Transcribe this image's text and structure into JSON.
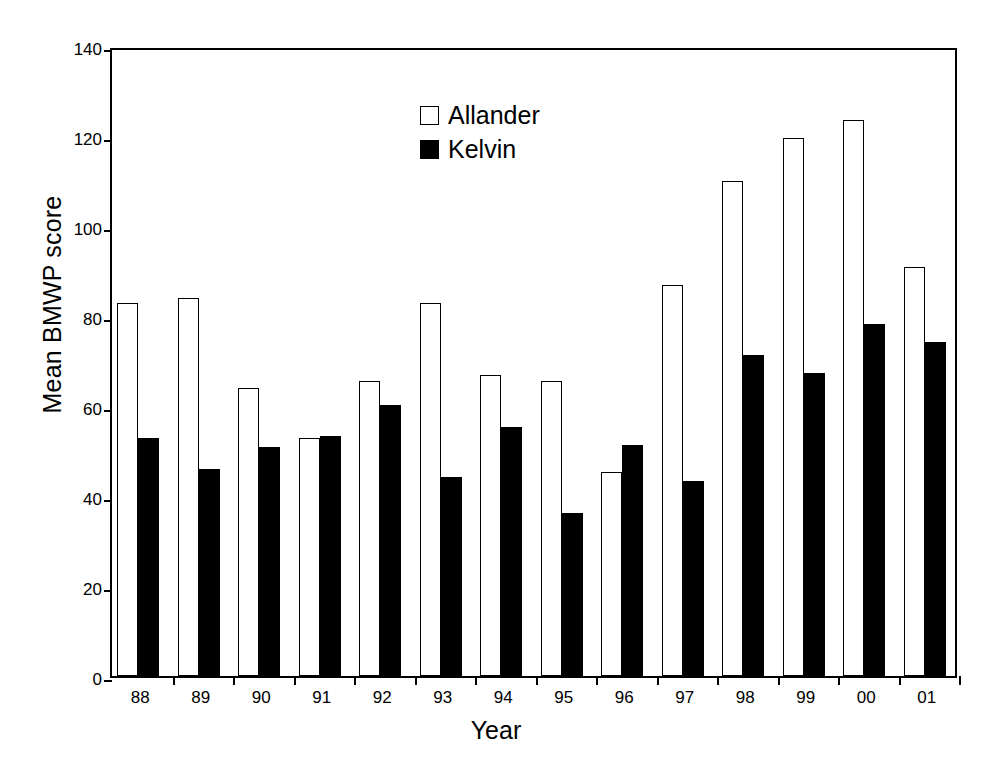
{
  "chart_data": {
    "type": "bar",
    "title": "",
    "xlabel": "Year",
    "ylabel": "Mean BMWP score",
    "ylim": [
      0,
      140
    ],
    "ytick_step": 20,
    "yticks": [
      0,
      20,
      40,
      60,
      80,
      100,
      120,
      140
    ],
    "grid": false,
    "legend_position": "top-center",
    "categories": [
      "88",
      "89",
      "90",
      "91",
      "92",
      "93",
      "94",
      "95",
      "96",
      "97",
      "98",
      "99",
      "00",
      "01"
    ],
    "series": [
      {
        "name": "Allander",
        "marker": "open-square",
        "color": "#ffffff",
        "edge_color": "#000000",
        "values": [
          83,
          84,
          64,
          53,
          65.5,
          83,
          67,
          65.5,
          45.3,
          87,
          110,
          119.5,
          123.5,
          91
        ]
      },
      {
        "name": "Kelvin",
        "marker": "filled-square",
        "color": "#000000",
        "edge_color": "#000000",
        "values": [
          53,
          46,
          51,
          53.3,
          60.3,
          44.3,
          55.3,
          36.3,
          51.3,
          43.3,
          71.3,
          67.3,
          78.3,
          74.3
        ]
      }
    ]
  },
  "axes": {
    "y_title": "Mean BMWP score",
    "x_title": "Year"
  },
  "legend": {
    "entries": [
      {
        "label": "Allander",
        "swatch": "open-square"
      },
      {
        "label": "Kelvin",
        "swatch": "filled-square"
      }
    ]
  },
  "caption": {
    "partial_text": ""
  }
}
